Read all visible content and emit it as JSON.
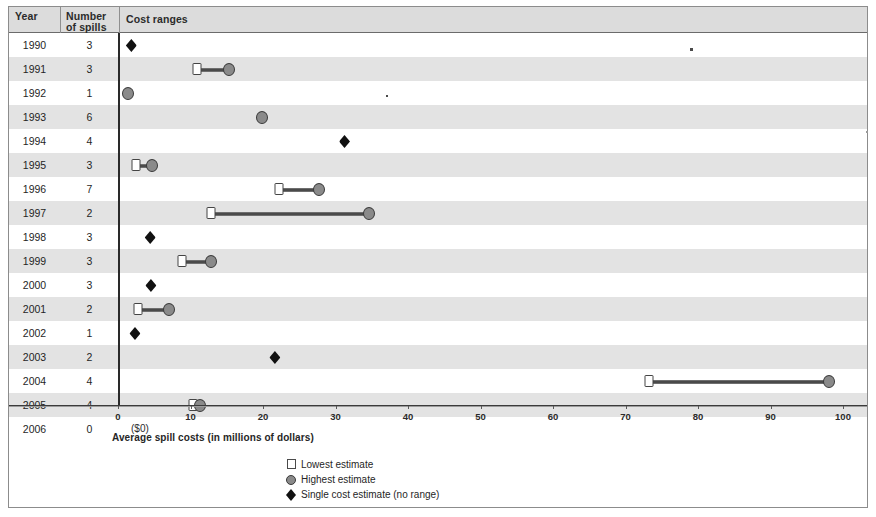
{
  "table": {
    "headers": {
      "year": "Year",
      "number_of_spills_line1": "Number",
      "number_of_spills_line2": "of spills",
      "cost_ranges": "Cost ranges"
    }
  },
  "axis": {
    "label": "Average spill costs (in millions of dollars)",
    "ticks": [
      "0",
      "10",
      "20",
      "30",
      "40",
      "50",
      "60",
      "70",
      "80",
      "90",
      "100"
    ],
    "min": 0,
    "max": 100
  },
  "legend": {
    "items": [
      {
        "symbol": "open-square",
        "label": "Lowest estimate"
      },
      {
        "symbol": "circle",
        "label": "Highest estimate"
      },
      {
        "symbol": "filled-diamond",
        "label": "Single cost estimate (no range)"
      }
    ]
  },
  "zero_note": "($0)",
  "chart_data": {
    "type": "range",
    "title": "Cost ranges",
    "xlabel": "Average spill costs (in millions of dollars)",
    "ylabel": "Year",
    "xlim": [
      0,
      100
    ],
    "grid": false,
    "legend_position": "bottom-center",
    "columns": [
      "Year",
      "Number of spills",
      "Lowest estimate",
      "Highest estimate",
      "Single cost estimate"
    ],
    "rows": [
      {
        "year": "1990",
        "spills": "3",
        "low": null,
        "high": null,
        "single": 0.6
      },
      {
        "year": "1991",
        "spills": "3",
        "low": 9.6,
        "high": 14.0,
        "single": null
      },
      {
        "year": "1992",
        "spills": "1",
        "low": null,
        "high": 0.1,
        "single": null
      },
      {
        "year": "1993",
        "spills": "6",
        "low": null,
        "high": 18.6,
        "single": null
      },
      {
        "year": "1994",
        "spills": "4",
        "low": null,
        "high": null,
        "single": 30.0
      },
      {
        "year": "1995",
        "spills": "3",
        "low": 1.2,
        "high": 3.5,
        "single": null
      },
      {
        "year": "1996",
        "spills": "7",
        "low": 21.0,
        "high": 26.5,
        "single": null
      },
      {
        "year": "1997",
        "spills": "2",
        "low": 11.6,
        "high": 33.4,
        "single": null
      },
      {
        "year": "1998",
        "spills": "3",
        "low": null,
        "high": null,
        "single": 3.2
      },
      {
        "year": "1999",
        "spills": "3",
        "low": 7.6,
        "high": 11.6,
        "single": null
      },
      {
        "year": "2000",
        "spills": "3",
        "low": null,
        "high": null,
        "single": 3.3
      },
      {
        "year": "2001",
        "spills": "2",
        "low": 1.5,
        "high": 5.8,
        "single": null
      },
      {
        "year": "2002",
        "spills": "1",
        "low": null,
        "high": null,
        "single": 1.1
      },
      {
        "year": "2003",
        "spills": "2",
        "low": null,
        "high": null,
        "single": 20.4
      },
      {
        "year": "2004",
        "spills": "4",
        "low": 72.0,
        "high": 96.8,
        "single": null
      },
      {
        "year": "2005",
        "spills": "4",
        "low": 9.1,
        "high": 10.0,
        "single": null
      },
      {
        "year": "2006",
        "spills": "0",
        "low": null,
        "high": null,
        "single": null,
        "note": "($0)"
      }
    ]
  }
}
